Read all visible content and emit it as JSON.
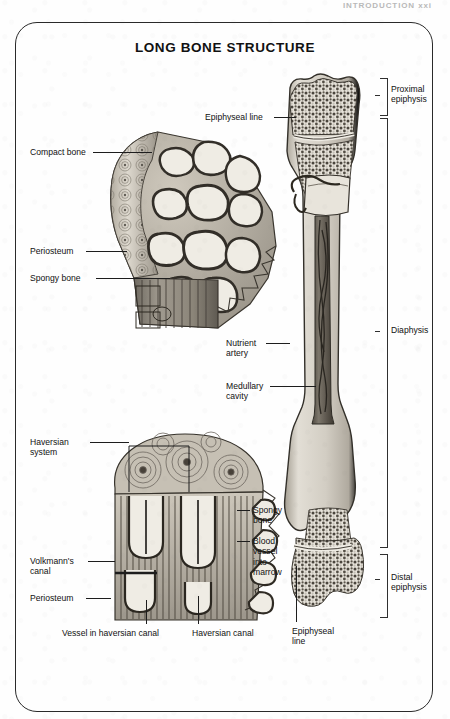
{
  "page": {
    "running_head": "INTRODUCTION   xxi",
    "frame_shape": "rounded-rectangle"
  },
  "figure": {
    "title": "LONG BONE STRUCTURE",
    "style": "grayscale anatomical engraving",
    "panels": [
      {
        "id": "proximal-cutaway",
        "caption": "Cut-away of proximal femur showing compact and spongy bone"
      },
      {
        "id": "haversian-cutaway",
        "caption": "Magnified wedge of compact bone showing haversian systems"
      },
      {
        "id": "whole-femur",
        "caption": "Longitudinal section of entire long bone"
      }
    ]
  },
  "labels": {
    "upper_left": [
      {
        "name": "compact-bone",
        "text": "Compact bone",
        "x": 30,
        "y": 147,
        "lead_x1": 93,
        "lead_x2": 152,
        "lead_y": 152
      },
      {
        "name": "periosteum-upper",
        "text": "Periosteum",
        "x": 30,
        "y": 246,
        "lead_x1": 86,
        "lead_x2": 127,
        "lead_y": 251
      },
      {
        "name": "spongy-bone-upper",
        "text": "Spongy bone",
        "x": 30,
        "y": 273,
        "lead_x1": 96,
        "lead_x2": 170,
        "lead_y": 278
      }
    ],
    "lower_left": [
      {
        "name": "haversian-system",
        "text": "Haversian\nsystem",
        "x": 30,
        "y": 437
      },
      {
        "name": "volkmanns-canal",
        "text": "Volkmann's\ncanal",
        "x": 30,
        "y": 556
      },
      {
        "name": "periosteum-lower",
        "text": "Periosteum",
        "x": 30,
        "y": 593
      }
    ],
    "lower_bottom": [
      {
        "name": "vessel-in-haversian-canal",
        "text": "Vessel in haversian canal",
        "x": 62,
        "y": 628
      },
      {
        "name": "haversian-canal",
        "text": "Haversian canal",
        "x": 192,
        "y": 628
      }
    ],
    "lower_right": [
      {
        "name": "spongy-bone-lower",
        "text": "Spongy\nbone",
        "x": 253,
        "y": 505
      },
      {
        "name": "blood-vessel-into-marrow",
        "text": "Blood\nvessel\ninto\nmarrow",
        "x": 253,
        "y": 536
      }
    ],
    "femur": [
      {
        "name": "epiphyseal-line-top",
        "text": "Epiphyseal line",
        "x": 205,
        "y": 112
      },
      {
        "name": "nutrient-artery",
        "text": "Nutrient\nartery",
        "x": 226,
        "y": 338
      },
      {
        "name": "medullary-cavity",
        "text": "Medullary\ncavity",
        "x": 226,
        "y": 381
      },
      {
        "name": "epiphyseal-line-bottom",
        "text": "Epiphyseal\nline",
        "x": 292,
        "y": 626
      }
    ],
    "brackets": [
      {
        "name": "proximal-epiphysis",
        "text": "Proximal\nepiphysis",
        "top": 78,
        "height": 36,
        "label_y": 84
      },
      {
        "name": "diaphysis",
        "text": "Diaphysis",
        "top": 118,
        "height": 428,
        "label_y": 327
      },
      {
        "name": "distal-epiphysis",
        "text": "Distal\nepiphysis",
        "top": 554,
        "height": 62,
        "label_y": 572
      }
    ]
  },
  "colors": {
    "ink": "#1d1d1d",
    "frame": "#2a2a2a",
    "bone_cortex": "#d8d4ca",
    "bone_shadow": "#8e887c",
    "marrow_dark": "#3b3731",
    "spongy_stipple": "#4a453d",
    "paper": "#fefefe"
  }
}
